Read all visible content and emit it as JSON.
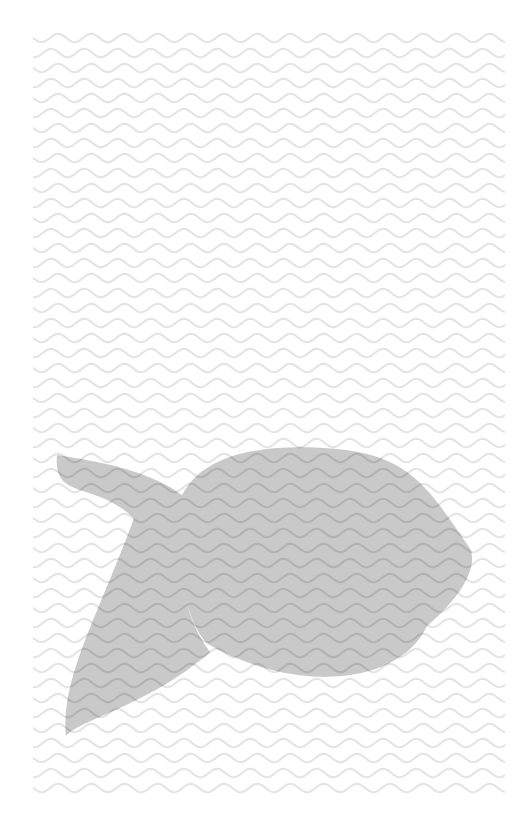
{
  "canvas": {
    "width": 514,
    "height": 836,
    "background_color": "#ffffff",
    "title": "Fish over wavy water pattern"
  },
  "palette": {
    "page_background": "#ffffff",
    "wave_line_background": "#e4e4e4",
    "wave_line_over_fish": "#b2b2b2",
    "fish_fill": "#c9c9c9",
    "fish_fill_opacity": "1"
  },
  "pattern": {
    "name": "wavy-water-lines",
    "description": "Horizontal rows of repeating sine-like wavy strokes covering most of the page",
    "field_left": 33,
    "field_right": 505,
    "field_top": 38,
    "field_bottom": 790,
    "row_spacing": 15,
    "wave_period": 33.2,
    "wave_amplitude": 4.2,
    "stroke_width": 2.1,
    "row_count": 51,
    "row_phase_shift": 7.0
  },
  "fish": {
    "name": "fish-silhouette",
    "fill_color": "#c9c9c9",
    "facing": "right",
    "bounding_box": {
      "x": 55,
      "y": 442,
      "width": 417,
      "height": 296
    },
    "body": {
      "name": "fish-body",
      "description": "Lens / egg shaped body with rounded belly and pointed snout at the right",
      "left": 178,
      "right": 471,
      "top": 443,
      "bottom": 690,
      "center_x": 325,
      "center_y": 566
    },
    "tail": {
      "name": "fish-tail",
      "description": "Crescent / boomerang caudal fin on the left with two tapered lobes",
      "upper_tip": {
        "x": 57,
        "y": 455
      },
      "lower_tip": {
        "x": 66,
        "y": 736
      },
      "notch": {
        "x": 176,
        "y": 516
      },
      "joint_top": {
        "x": 205,
        "y": 497
      },
      "joint_bottom": {
        "x": 206,
        "y": 648
      }
    }
  },
  "labels": {
    "artwork_title": "Fish",
    "artwork_subject": "fish over wavy water pattern"
  }
}
